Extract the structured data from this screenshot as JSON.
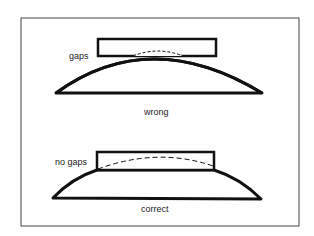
{
  "diagram": {
    "top_panel": {
      "callout": "gaps",
      "caption": "wrong"
    },
    "bottom_panel": {
      "callout": "no gaps",
      "caption": "correct"
    },
    "colors": {
      "stroke": "#111111",
      "frame": "#444444",
      "background": "#ffffff"
    }
  }
}
